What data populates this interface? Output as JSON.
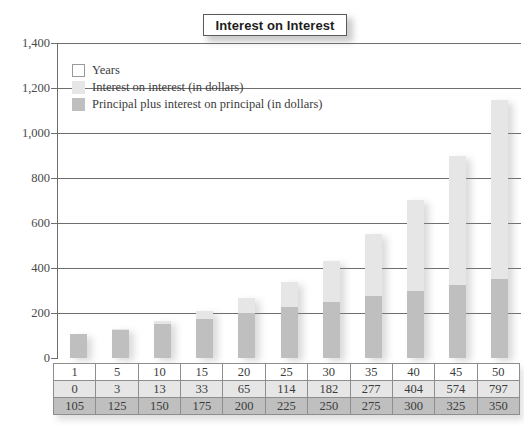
{
  "title": "Interest on Interest",
  "legend": {
    "items": [
      {
        "label": "Years",
        "swatch": "white-outline"
      },
      {
        "label": "Interest on interest (in dollars)",
        "swatch": "light-gray"
      },
      {
        "label": "Principal plus interest on principal (in dollars)",
        "swatch": "medium-gray"
      }
    ]
  },
  "colors": {
    "interest_on_interest": "#e6e6e6",
    "principal_plus_interest": "#bfbfbf",
    "years_swatch": "#ffffff",
    "gridline": "#6e6e6e",
    "text": "#3b3b3b"
  },
  "chart_data": {
    "type": "bar",
    "title": "Interest on Interest",
    "xlabel": "",
    "ylabel": "",
    "ylim": [
      0,
      1400
    ],
    "yticks": [
      0,
      200,
      400,
      600,
      800,
      1000,
      1200,
      1400
    ],
    "ytick_labels": [
      "0",
      "200",
      "400",
      "600",
      "800",
      "1,000",
      "1,200",
      "1,400"
    ],
    "grid": true,
    "stacked": true,
    "legend_position": "upper-left-inside",
    "categories": [
      "1",
      "5",
      "10",
      "15",
      "20",
      "25",
      "30",
      "35",
      "40",
      "45",
      "50"
    ],
    "series": [
      {
        "name": "Principal plus interest on principal (in dollars)",
        "color": "#bfbfbf",
        "values": [
          105,
          125,
          150,
          175,
          200,
          225,
          250,
          275,
          300,
          325,
          350
        ]
      },
      {
        "name": "Interest on interest (in dollars)",
        "color": "#e6e6e6",
        "values": [
          0,
          3,
          13,
          33,
          65,
          114,
          182,
          277,
          404,
          574,
          797
        ]
      }
    ],
    "totals": [
      105,
      128,
      163,
      208,
      265,
      339,
      432,
      552,
      704,
      899,
      1147
    ]
  },
  "table": {
    "rows": [
      {
        "name": "years",
        "cells": [
          "1",
          "5",
          "10",
          "15",
          "20",
          "25",
          "30",
          "35",
          "40",
          "45",
          "50"
        ]
      },
      {
        "name": "interest-on-interest",
        "cells": [
          "0",
          "3",
          "13",
          "33",
          "65",
          "114",
          "182",
          "277",
          "404",
          "574",
          "797"
        ]
      },
      {
        "name": "principal-plus-interest",
        "cells": [
          "105",
          "125",
          "150",
          "175",
          "200",
          "225",
          "250",
          "275",
          "300",
          "325",
          "350"
        ]
      }
    ]
  }
}
